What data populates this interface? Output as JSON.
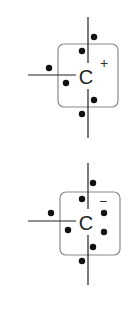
{
  "diagrams": [
    {
      "name": "carbocation",
      "atom_label": "C",
      "charge_label": "+",
      "box": {
        "x": 58,
        "y": 44,
        "w": 60,
        "h": 63,
        "r": 6
      },
      "bonds": [
        {
          "x1": 88,
          "y1": 17,
          "x2": 88,
          "y2": 63
        },
        {
          "x1": 88,
          "y1": 89,
          "x2": 88,
          "y2": 138
        },
        {
          "x1": 28,
          "y1": 75,
          "x2": 76,
          "y2": 75
        }
      ],
      "atom_pos": {
        "x": 86,
        "y": 84
      },
      "charge_pos": {
        "x": 104,
        "y": 68
      },
      "electrons": [
        {
          "x": 94,
          "y": 37
        },
        {
          "x": 82,
          "y": 51
        },
        {
          "x": 49,
          "y": 68
        },
        {
          "x": 66,
          "y": 83
        },
        {
          "x": 94,
          "y": 100
        },
        {
          "x": 82,
          "y": 114
        }
      ]
    },
    {
      "name": "carbanion",
      "atom_label": "C",
      "charge_label": "−",
      "box": {
        "x": 60,
        "y": 192,
        "w": 60,
        "h": 63,
        "r": 6
      },
      "bonds": [
        {
          "x1": 88,
          "y1": 163,
          "x2": 88,
          "y2": 209
        },
        {
          "x1": 88,
          "y1": 235,
          "x2": 88,
          "y2": 285
        },
        {
          "x1": 28,
          "y1": 221,
          "x2": 76,
          "y2": 221
        }
      ],
      "atom_pos": {
        "x": 86,
        "y": 230
      },
      "charge_pos": {
        "x": 103,
        "y": 206
      },
      "electrons": [
        {
          "x": 93,
          "y": 183
        },
        {
          "x": 82,
          "y": 199
        },
        {
          "x": 51,
          "y": 213
        },
        {
          "x": 68,
          "y": 230
        },
        {
          "x": 104,
          "y": 213
        },
        {
          "x": 104,
          "y": 232
        },
        {
          "x": 93,
          "y": 247
        },
        {
          "x": 82,
          "y": 261
        }
      ]
    }
  ]
}
